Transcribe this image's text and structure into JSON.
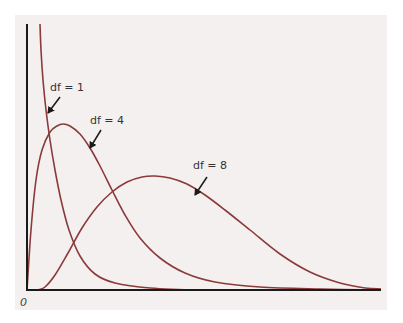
{
  "chart_data": {
    "type": "line",
    "title": "",
    "xlabel": "",
    "ylabel": "",
    "origin_label": "0",
    "grid": false,
    "legend": "annotations with arrows",
    "curve_color": "#8b3a3a",
    "axis_color": "#1a1a1a",
    "series": [
      {
        "name": "df = 1",
        "label": "df = 1",
        "points": [
          [
            40,
            24
          ],
          [
            41,
            50
          ],
          [
            43,
            80
          ],
          [
            46,
            110
          ],
          [
            50,
            140
          ],
          [
            55,
            170
          ],
          [
            61,
            200
          ],
          [
            69,
            230
          ],
          [
            80,
            256
          ],
          [
            95,
            274
          ],
          [
            115,
            283
          ],
          [
            150,
            288
          ],
          [
            200,
            290
          ],
          [
            260,
            290
          ]
        ],
        "label_pos": [
          50,
          91
        ],
        "arrow": [
          [
            60,
            97
          ],
          [
            48,
            113
          ]
        ]
      },
      {
        "name": "df = 4",
        "label": "df = 4",
        "points": [
          [
            27,
            290
          ],
          [
            31,
            230
          ],
          [
            36,
            180
          ],
          [
            42,
            150
          ],
          [
            50,
            132
          ],
          [
            57,
            126
          ],
          [
            63,
            124
          ],
          [
            70,
            126
          ],
          [
            80,
            134
          ],
          [
            90,
            148
          ],
          [
            100,
            166
          ],
          [
            112,
            190
          ],
          [
            125,
            215
          ],
          [
            140,
            238
          ],
          [
            160,
            258
          ],
          [
            185,
            273
          ],
          [
            215,
            282
          ],
          [
            260,
            287
          ],
          [
            320,
            289
          ],
          [
            381,
            290
          ]
        ],
        "label_pos": [
          90,
          124
        ],
        "arrow": [
          [
            101,
            130
          ],
          [
            90,
            148
          ]
        ]
      },
      {
        "name": "df = 8",
        "label": "df = 8",
        "points": [
          [
            38,
            290
          ],
          [
            45,
            287
          ],
          [
            55,
            275
          ],
          [
            68,
            253
          ],
          [
            82,
            228
          ],
          [
            97,
            207
          ],
          [
            112,
            192
          ],
          [
            127,
            182
          ],
          [
            142,
            177
          ],
          [
            155,
            176
          ],
          [
            170,
            178
          ],
          [
            187,
            184
          ],
          [
            205,
            195
          ],
          [
            225,
            210
          ],
          [
            250,
            230
          ],
          [
            280,
            254
          ],
          [
            310,
            272
          ],
          [
            340,
            283
          ],
          [
            365,
            288
          ],
          [
            381,
            289
          ]
        ],
        "label_pos": [
          193,
          169
        ],
        "arrow": [
          [
            207,
            177
          ],
          [
            195,
            195
          ]
        ]
      }
    ],
    "axes": {
      "origin": [
        27,
        290
      ],
      "y_top": 24,
      "x_right": 381
    }
  }
}
